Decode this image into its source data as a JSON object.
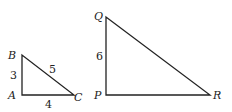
{
  "diagram": {
    "type": "similar-right-triangles",
    "triangles": [
      {
        "name": "ABC",
        "vertices": {
          "A": "A",
          "B": "B",
          "C": "C"
        },
        "sides": {
          "AB": "3",
          "BC": "5",
          "AC": "4"
        }
      },
      {
        "name": "PQR",
        "vertices": {
          "P": "P",
          "Q": "Q",
          "R": "R"
        },
        "sides": {
          "PQ": "6"
        }
      }
    ]
  }
}
